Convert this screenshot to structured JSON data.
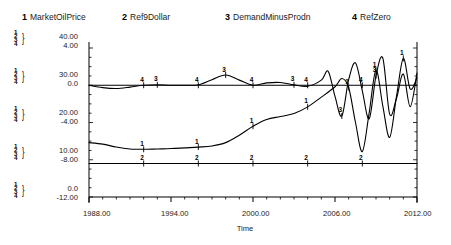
{
  "chart_data": {
    "type": "line",
    "title": "",
    "xlabel": "Time",
    "ylabel": "",
    "xlim": [
      1988.0,
      2012.0
    ],
    "grid": false,
    "legend_position": "top",
    "x_tick_labels": [
      "1988.00",
      "1994.00",
      "2000.00",
      "2006.00",
      "2012.00"
    ],
    "x_ticks": [
      1988.0,
      1994.0,
      2000.0,
      2006.0,
      2012.0
    ],
    "axis_scales": [
      {
        "name": "primary",
        "applies_to_series": [
          1,
          2
        ],
        "labels": [
          "40.00",
          "30.00",
          "20.00",
          "10.00",
          "0.0"
        ],
        "values": [
          40.0,
          30.0,
          20.0,
          10.0,
          0.0
        ],
        "ylim": [
          0.0,
          40.0
        ]
      },
      {
        "name": "secondary",
        "applies_to_series": [
          3,
          4
        ],
        "labels": [
          "4.00",
          "0.0",
          "-4.00",
          "-8.00",
          "-12.00"
        ],
        "values": [
          4.0,
          0.0,
          -4.0,
          -8.0,
          -12.0
        ],
        "ylim": [
          -12.0,
          4.0
        ]
      }
    ],
    "axis_stack_labels": [
      "1",
      "2",
      "3",
      "4"
    ],
    "legend": [
      {
        "num": "1",
        "label": "MarketOilPrice"
      },
      {
        "num": "2",
        "label": "Ref9Dollar"
      },
      {
        "num": "3",
        "label": "DemandMinusProdn"
      },
      {
        "num": "4",
        "label": "RefZero"
      }
    ],
    "series": [
      {
        "name": "MarketOilPrice",
        "num": "1",
        "scale": "primary",
        "x": [
          1988.0,
          1989.0,
          1990.0,
          1991.0,
          1992.0,
          1993.0,
          1994.0,
          1995.0,
          1996.0,
          1997.0,
          1998.0,
          1999.0,
          2000.0,
          2001.0,
          2002.0,
          2003.0,
          2004.0,
          2005.0,
          2006.0,
          2006.5,
          2007.0,
          2007.5,
          2008.0,
          2008.5,
          2009.0,
          2009.5,
          2010.0,
          2010.5,
          2011.0,
          2011.5,
          2012.0
        ],
        "values": [
          14.6,
          14.2,
          13.4,
          12.9,
          12.8,
          12.9,
          13.0,
          13.2,
          13.4,
          13.7,
          14.6,
          16.6,
          19.0,
          20.8,
          21.6,
          22.4,
          24.2,
          26.8,
          29.6,
          31.8,
          29.4,
          20.0,
          12.2,
          22.6,
          34.0,
          24.4,
          16.0,
          27.0,
          37.2,
          29.0,
          32.0
        ]
      },
      {
        "name": "Ref9Dollar",
        "num": "2",
        "scale": "primary",
        "x": [
          1988.0,
          1992.0,
          1996.0,
          2000.0,
          2004.0,
          2008.0,
          2012.0
        ],
        "values": [
          9.0,
          9.0,
          9.0,
          9.0,
          9.0,
          9.0,
          9.0
        ]
      },
      {
        "name": "DemandMinusProdn",
        "num": "3",
        "scale": "secondary",
        "x": [
          1988.0,
          1989.0,
          1990.0,
          1991.0,
          1992.0,
          1993.0,
          1994.0,
          1995.0,
          1996.0,
          1997.0,
          1998.0,
          1999.0,
          2000.0,
          2001.0,
          2002.0,
          2003.0,
          2004.0,
          2005.0,
          2005.5,
          2006.0,
          2006.5,
          2007.0,
          2007.5,
          2008.0,
          2008.5,
          2009.0,
          2009.5,
          2010.0,
          2010.5,
          2011.0,
          2011.5,
          2012.0
        ],
        "values": [
          0.0,
          -0.25,
          -0.35,
          -0.2,
          0.0,
          0.05,
          0.0,
          0.0,
          0.05,
          0.6,
          1.1,
          0.55,
          0.0,
          0.25,
          0.3,
          0.05,
          -0.1,
          0.55,
          1.5,
          -1.2,
          -3.3,
          0.6,
          2.4,
          -0.6,
          -3.6,
          1.0,
          2.9,
          -3.1,
          -1.4,
          1.2,
          -2.3,
          1.3
        ]
      },
      {
        "name": "RefZero",
        "num": "4",
        "scale": "secondary",
        "x": [
          1988.0,
          1992.0,
          1996.0,
          2000.0,
          2004.0,
          2008.0,
          2012.0
        ],
        "values": [
          0.0,
          0.0,
          0.0,
          0.0,
          0.0,
          0.0,
          0.0
        ]
      }
    ]
  }
}
